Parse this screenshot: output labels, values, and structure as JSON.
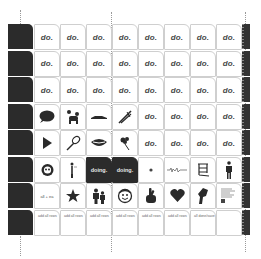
{
  "grid": {
    "rows": [
      {
        "cells": [
          {
            "type": "text",
            "label": "do."
          },
          {
            "type": "text",
            "label": "do."
          },
          {
            "type": "text",
            "label": "do."
          },
          {
            "type": "text",
            "label": "do."
          },
          {
            "type": "text",
            "label": "do."
          },
          {
            "type": "text",
            "label": "do."
          },
          {
            "type": "text",
            "label": "do."
          },
          {
            "type": "text",
            "label": "do."
          }
        ]
      },
      {
        "cells": [
          {
            "type": "text",
            "label": "do."
          },
          {
            "type": "text",
            "label": "do."
          },
          {
            "type": "text",
            "label": "do."
          },
          {
            "type": "text",
            "label": "do."
          },
          {
            "type": "text",
            "label": "do."
          },
          {
            "type": "text",
            "label": "do."
          },
          {
            "type": "text",
            "label": "do."
          },
          {
            "type": "text",
            "label": "do."
          }
        ]
      },
      {
        "cells": [
          {
            "type": "text",
            "label": "do."
          },
          {
            "type": "text",
            "label": "do."
          },
          {
            "type": "text",
            "label": "do."
          },
          {
            "type": "text",
            "label": "do."
          },
          {
            "type": "text",
            "label": "do."
          },
          {
            "type": "text",
            "label": "do."
          },
          {
            "type": "text",
            "label": "do."
          },
          {
            "type": "text",
            "label": "do."
          }
        ]
      },
      {
        "cells": [
          {
            "type": "icon",
            "icon": "speech-bubble-icon"
          },
          {
            "type": "icon",
            "icon": "poodle-icon"
          },
          {
            "type": "icon",
            "icon": "car-icon"
          },
          {
            "type": "icon",
            "icon": "tweezers-icon"
          },
          {
            "type": "text",
            "label": "do."
          },
          {
            "type": "text",
            "label": "do."
          },
          {
            "type": "text",
            "label": "do."
          },
          {
            "type": "text",
            "label": "do."
          }
        ]
      },
      {
        "cells": [
          {
            "type": "icon",
            "icon": "play-icon"
          },
          {
            "type": "icon",
            "icon": "whisk-icon"
          },
          {
            "type": "icon",
            "icon": "lips-icon"
          },
          {
            "type": "icon",
            "icon": "bouquet-icon"
          },
          {
            "type": "text",
            "label": "do."
          },
          {
            "type": "text",
            "label": "do."
          },
          {
            "type": "text",
            "label": "do."
          },
          {
            "type": "text",
            "label": "do."
          }
        ]
      },
      {
        "cells": [
          {
            "type": "icon",
            "icon": "panda-icon"
          },
          {
            "type": "icon",
            "icon": "figure-icon"
          },
          {
            "type": "dark",
            "label": "doing."
          },
          {
            "type": "dark",
            "label": "doing."
          },
          {
            "type": "icon",
            "icon": "dot-icon"
          },
          {
            "type": "icon",
            "icon": "waveform-icon"
          },
          {
            "type": "icon",
            "icon": "chair-glyph-icon"
          },
          {
            "type": "icon",
            "icon": "person-silhouette-icon"
          }
        ]
      },
      {
        "cells": [
          {
            "type": "mid",
            "label": "all + ea"
          },
          {
            "type": "icon",
            "icon": "star-icon"
          },
          {
            "type": "icon",
            "icon": "two-people-icon"
          },
          {
            "type": "icon",
            "icon": "face-icon"
          },
          {
            "type": "icon",
            "icon": "crossed-fingers-icon"
          },
          {
            "type": "icon",
            "icon": "heart-icon"
          },
          {
            "type": "icon",
            "icon": "fist-icon"
          },
          {
            "type": "icon",
            "icon": "document-icon"
          }
        ]
      },
      {
        "cells": [
          {
            "type": "small",
            "label": "add all rows"
          },
          {
            "type": "small",
            "label": "add all rows"
          },
          {
            "type": "small",
            "label": "add all rows"
          },
          {
            "type": "small",
            "label": "add all rows"
          },
          {
            "type": "small",
            "label": "add all rows"
          },
          {
            "type": "small",
            "label": "add all rows"
          },
          {
            "type": "small",
            "label": "all done/save"
          },
          {
            "type": "empty"
          }
        ]
      }
    ]
  }
}
